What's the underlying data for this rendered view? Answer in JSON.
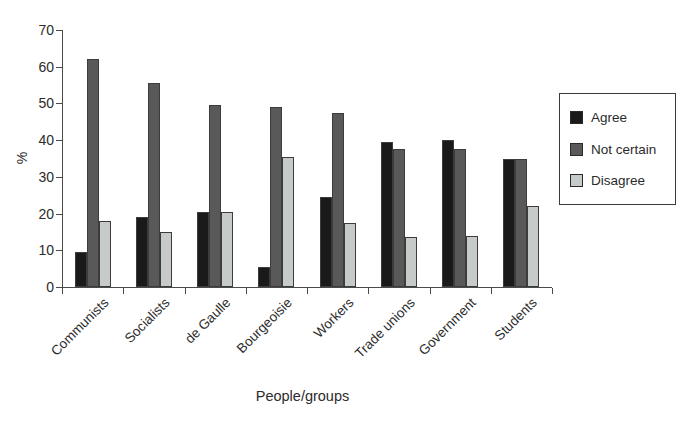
{
  "chart_data": {
    "type": "bar",
    "title": "",
    "xlabel": "People/groups",
    "ylabel": "%",
    "ylim": [
      0,
      70
    ],
    "yticks": [
      0,
      10,
      20,
      30,
      40,
      50,
      60,
      70
    ],
    "grid": false,
    "legend_position": "right",
    "categories": [
      "Communists",
      "Socialists",
      "de Gaulle",
      "Bourgeoisie",
      "Workers",
      "Trade unions",
      "Government",
      "Students"
    ],
    "series": [
      {
        "name": "Agree",
        "color": "#1a1a1a",
        "values": [
          9.5,
          19,
          20.5,
          5.5,
          24.5,
          39.5,
          40,
          35
        ]
      },
      {
        "name": "Not certain",
        "color": "#595959",
        "values": [
          62,
          55.5,
          49.5,
          49,
          47.5,
          37.5,
          37.5,
          35
        ]
      },
      {
        "name": "Disagree",
        "color": "#c6cac9",
        "values": [
          18,
          15,
          20.5,
          35.5,
          17.5,
          13.5,
          14,
          22
        ]
      }
    ],
    "axis_color": "#4a4a4a",
    "text_color": "#2b2b2b"
  }
}
